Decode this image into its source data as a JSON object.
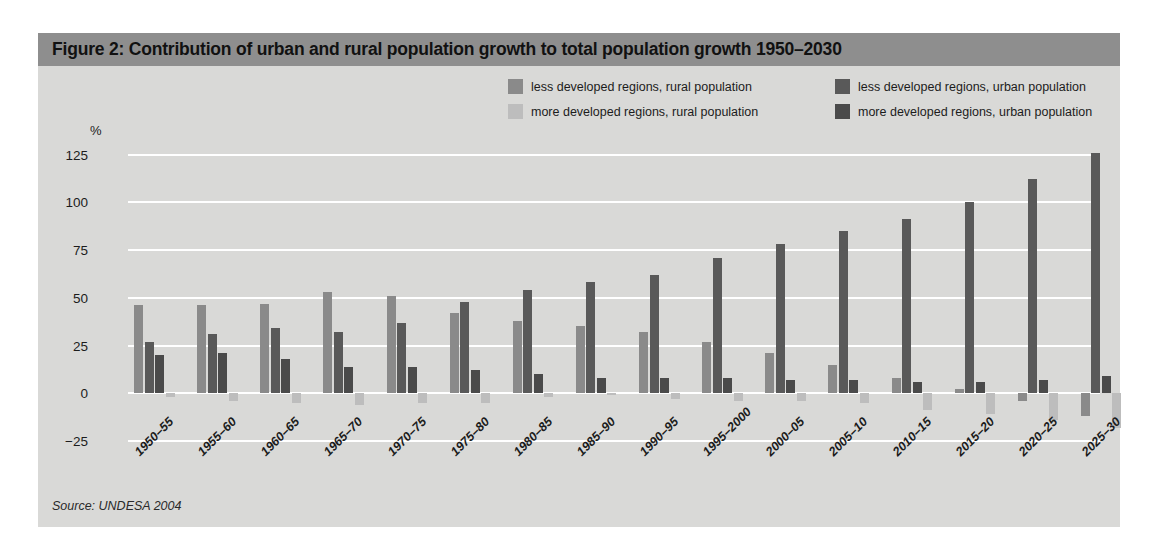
{
  "figure": {
    "title": "Figure 2: Contribution of urban and rural population growth to total population growth 1950–2030",
    "source": "Source: UNDESA 2004",
    "axis_unit": "%"
  },
  "colors": {
    "panel_background": "#d9d9d7",
    "title_bar": "#8e8e8e",
    "gridline": "#ffffff",
    "less_developed_rural": "#8a8a8a",
    "less_developed_urban": "#595959",
    "more_developed_rural": "#bdbdbd",
    "more_developed_urban": "#4a4a4a",
    "text": "#1c1c1c"
  },
  "chart_data": {
    "type": "bar",
    "title": "Figure 2: Contribution of urban and rural population growth to total population growth 1950–2030",
    "xlabel": "",
    "ylabel": "%",
    "ylim": [
      -25,
      130
    ],
    "yticks": [
      125,
      100,
      75,
      50,
      25,
      0,
      -25
    ],
    "ytick_labels": [
      "125",
      "100",
      "75",
      "50",
      "25",
      "0",
      "−25"
    ],
    "grid": true,
    "legend_position": "top-right",
    "categories": [
      "1950–55",
      "1955–60",
      "1960–65",
      "1965–70",
      "1970–75",
      "1975–80",
      "1980–85",
      "1985–90",
      "1990–95",
      "1995–2000",
      "2000–05",
      "2005–10",
      "2010–15",
      "2015–20",
      "2020–25",
      "2025–30"
    ],
    "series": [
      {
        "name": "less developed regions, rural population",
        "color": "#8a8a8a",
        "values": [
          46,
          46,
          47,
          53,
          51,
          42,
          38,
          35,
          32,
          27,
          21,
          15,
          8,
          2,
          -4,
          -12
        ]
      },
      {
        "name": "less developed regions, urban population",
        "color": "#595959",
        "values": [
          27,
          31,
          34,
          32,
          37,
          48,
          54,
          58,
          62,
          71,
          78,
          85,
          91,
          100,
          112,
          126
        ]
      },
      {
        "name": "more developed regions, urban population",
        "color": "#4a4a4a",
        "values": [
          20,
          21,
          18,
          14,
          14,
          12,
          10,
          8,
          8,
          8,
          7,
          7,
          6,
          6,
          7,
          9
        ]
      },
      {
        "name": "more developed regions, rural population",
        "color": "#bdbdbd",
        "values": [
          -2,
          -4,
          -5,
          -6,
          -5,
          -5,
          -2,
          -1,
          -3,
          -4,
          -4,
          -5,
          -9,
          -11,
          -14,
          -18
        ]
      }
    ]
  },
  "legend": [
    {
      "label": "less developed regions, rural population",
      "color": "#8a8a8a"
    },
    {
      "label": "more developed regions, rural population",
      "color": "#bdbdbd"
    },
    {
      "label": "less developed regions, urban population",
      "color": "#595959"
    },
    {
      "label": "more developed regions, urban population",
      "color": "#4a4a4a"
    }
  ]
}
